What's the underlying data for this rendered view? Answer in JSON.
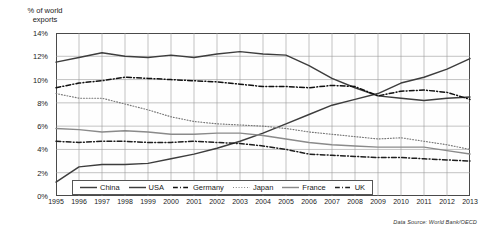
{
  "axis": {
    "ylabel": "% of world\nexports",
    "yticks": [
      "0%",
      "2%",
      "4%",
      "6%",
      "8%",
      "10%",
      "12%",
      "14%"
    ],
    "xticks": [
      "1995",
      "1996",
      "1997",
      "1998",
      "1999",
      "2000",
      "2001",
      "2002",
      "2003",
      "2004",
      "2005",
      "2006",
      "2007",
      "2008",
      "2009",
      "2010",
      "2011",
      "2012",
      "2013"
    ]
  },
  "source_note": "Data Source: World Bank/OECD",
  "chart_data": {
    "type": "line",
    "title": "",
    "xlabel": "",
    "ylabel": "% of world exports",
    "xlim": [
      1995,
      2013
    ],
    "ylim": [
      0,
      14
    ],
    "ytick_step": 2,
    "grid": true,
    "legend_position": "bottom-inside",
    "x": [
      1995,
      1996,
      1997,
      1998,
      1999,
      2000,
      2001,
      2002,
      2003,
      2004,
      2005,
      2006,
      2007,
      2008,
      2009,
      2010,
      2011,
      2012,
      2013
    ],
    "series": [
      {
        "name": "China",
        "style": "solid",
        "color": "#3d3d3d",
        "values": [
          1.2,
          2.5,
          2.7,
          2.7,
          2.8,
          3.2,
          3.6,
          4.1,
          4.7,
          5.4,
          6.2,
          7.0,
          7.8,
          8.3,
          8.8,
          9.7,
          10.2,
          10.9,
          11.8
        ]
      },
      {
        "name": "USA",
        "style": "solid",
        "color": "#3d3d3d",
        "values": [
          11.5,
          11.9,
          12.3,
          12.0,
          11.9,
          12.1,
          11.9,
          12.2,
          12.4,
          12.2,
          12.1,
          11.2,
          10.1,
          9.3,
          8.6,
          8.4,
          8.2,
          8.4,
          8.5
        ]
      },
      {
        "name": "Germany",
        "style": "dashdot",
        "color": "#111111",
        "values": [
          9.3,
          9.7,
          9.9,
          10.2,
          10.1,
          10.0,
          9.9,
          9.8,
          9.6,
          9.4,
          9.4,
          9.3,
          9.5,
          9.4,
          8.6,
          9.0,
          9.1,
          8.9,
          8.3
        ]
      },
      {
        "name": "Japan",
        "style": "dotted",
        "color": "#777777",
        "values": [
          8.8,
          8.4,
          8.4,
          7.9,
          7.4,
          6.8,
          6.4,
          6.2,
          6.1,
          6.0,
          5.8,
          5.5,
          5.3,
          5.1,
          4.9,
          5.0,
          4.7,
          4.4,
          4.0
        ]
      },
      {
        "name": "France",
        "style": "solid",
        "color": "#8a8a8a",
        "values": [
          5.8,
          5.7,
          5.5,
          5.6,
          5.5,
          5.3,
          5.3,
          5.4,
          5.4,
          5.2,
          4.9,
          4.6,
          4.4,
          4.3,
          4.2,
          4.2,
          4.2,
          3.9,
          3.6
        ]
      },
      {
        "name": "UK",
        "style": "dashdot",
        "color": "#1f1f1f",
        "values": [
          4.7,
          4.6,
          4.7,
          4.7,
          4.6,
          4.6,
          4.7,
          4.6,
          4.5,
          4.3,
          4.0,
          3.6,
          3.5,
          3.4,
          3.3,
          3.3,
          3.2,
          3.1,
          3.0
        ]
      }
    ]
  },
  "legend": {
    "items": [
      {
        "label": "China"
      },
      {
        "label": "USA"
      },
      {
        "label": "Germany"
      },
      {
        "label": "Japan"
      },
      {
        "label": "France"
      },
      {
        "label": "UK"
      }
    ]
  }
}
